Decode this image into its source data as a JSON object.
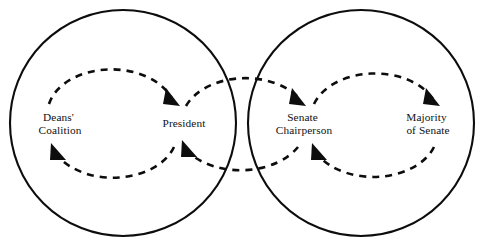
{
  "figure": {
    "type": "diagram",
    "diagram_kind": "feedback-loop",
    "background_color": "#ffffff",
    "line_color": "#0d0d0d",
    "width": 487,
    "height": 241,
    "top_edge_artifact": ""
  },
  "containers": [
    {
      "id": "left-system",
      "name": "left-boundary-circle",
      "cx": 123,
      "cy": 123,
      "r": 113
    },
    {
      "id": "right-system",
      "name": "right-boundary-circle",
      "cx": 361,
      "cy": 123,
      "r": 113
    }
  ],
  "nodes": [
    {
      "id": "deans-coalition",
      "label_line1": "Deans'",
      "label_line2": "Coalition",
      "x": 60,
      "y": 121
    },
    {
      "id": "president",
      "label_line1": "President",
      "label_line2": "",
      "x": 184,
      "y": 127
    },
    {
      "id": "senate-chairperson",
      "label_line1": "Senate",
      "label_line2": "Chairperson",
      "x": 304,
      "y": 121
    },
    {
      "id": "majority-of-senate",
      "label_line1": "Majority",
      "label_line2": "of Senate",
      "x": 428,
      "y": 121
    }
  ],
  "loops": [
    {
      "id": "loop-deans-president",
      "from": "deans-coalition",
      "to": "president",
      "style": "dashed",
      "direction": "clockwise",
      "forward_arrow": "arrowhead-to-president",
      "return_arrow": "arrowhead-to-deans-coalition"
    },
    {
      "id": "loop-president-senate-chair",
      "from": "president",
      "to": "senate-chairperson",
      "style": "dashed",
      "direction": "clockwise",
      "forward_arrow": "arrowhead-to-senate-chairperson",
      "return_arrow": "arrowhead-to-president"
    },
    {
      "id": "loop-senate-chair-majority",
      "from": "senate-chairperson",
      "to": "majority-of-senate",
      "style": "dashed",
      "direction": "clockwise",
      "forward_arrow": "arrowhead-to-majority-of-senate",
      "return_arrow": "arrowhead-to-senate-chairperson"
    }
  ]
}
